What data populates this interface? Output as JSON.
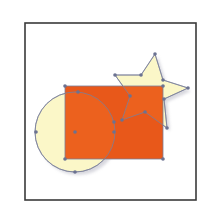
{
  "figure": {
    "frame": {
      "x": 25,
      "y": 23,
      "width": 171,
      "height": 177,
      "stroke": "#3a3a3a",
      "fill": "#ffffff"
    },
    "colors": {
      "orange_fill": "#E8581A",
      "cream_fill": "#FBF7C8",
      "path_stroke": "#7a7f99",
      "anchor_point": "#6b7291",
      "shadow": "#b8b8c4"
    },
    "shapes": [
      {
        "type": "circle",
        "name": "circle",
        "cx": 75,
        "cy": 132,
        "r": 40,
        "fill": "cream_fill"
      },
      {
        "type": "rect",
        "name": "rectangle",
        "x": 65,
        "y": 86,
        "width": 98,
        "height": 73,
        "fill": "orange_fill"
      },
      {
        "type": "star",
        "name": "star",
        "points": [
          [
            155,
            54
          ],
          [
            141,
            75
          ],
          [
            115,
            75
          ],
          [
            130,
            96
          ],
          [
            122,
            120
          ],
          [
            145,
            112
          ],
          [
            167,
            128
          ],
          [
            164,
            99
          ],
          [
            188,
            88
          ],
          [
            163,
            80
          ]
        ],
        "fill": "cream_fill"
      }
    ],
    "anchor_points": [
      [
        65,
        86
      ],
      [
        163,
        86
      ],
      [
        65,
        159
      ],
      [
        163,
        159
      ],
      [
        36,
        132
      ],
      [
        75,
        132
      ],
      [
        75,
        172
      ],
      [
        78,
        92
      ],
      [
        114,
        122
      ],
      [
        114,
        132
      ],
      [
        155,
        54
      ],
      [
        141,
        75
      ],
      [
        115,
        75
      ],
      [
        130,
        96
      ],
      [
        122,
        120
      ],
      [
        145,
        112
      ],
      [
        167,
        128
      ],
      [
        164,
        99
      ],
      [
        188,
        88
      ],
      [
        163,
        80
      ]
    ]
  }
}
